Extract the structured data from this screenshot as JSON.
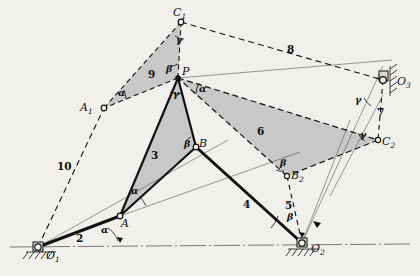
{
  "figure": {
    "type": "kinematic-linkage-diagram",
    "background_color": "#f2f0ec",
    "fill_color": "#c8c8c8",
    "stroke_color": "#111111"
  },
  "points": [
    {
      "id": "O1",
      "label": "O",
      "sub": "1",
      "x": 38,
      "y": 247,
      "kind": "ground-pivot"
    },
    {
      "id": "O2",
      "label": "O",
      "sub": "2",
      "x": 302,
      "y": 243,
      "kind": "ground-pivot"
    },
    {
      "id": "O3",
      "label": "O",
      "sub": "3",
      "x": 383,
      "y": 80,
      "kind": "ground-pivot"
    },
    {
      "id": "A",
      "label": "A",
      "sub": "",
      "x": 120,
      "y": 216,
      "kind": "joint"
    },
    {
      "id": "B",
      "label": "B",
      "sub": "",
      "x": 196,
      "y": 147,
      "kind": "joint"
    },
    {
      "id": "P",
      "label": "P",
      "sub": "",
      "x": 178,
      "y": 78,
      "kind": "joint"
    },
    {
      "id": "A1",
      "label": "A",
      "sub": "1",
      "x": 104,
      "y": 108,
      "kind": "joint"
    },
    {
      "id": "B2",
      "label": "B",
      "sub": "2",
      "x": 287,
      "y": 176,
      "kind": "joint"
    },
    {
      "id": "C1",
      "label": "C",
      "sub": "1",
      "x": 181,
      "y": 22,
      "kind": "joint"
    },
    {
      "id": "C2",
      "label": "C",
      "sub": "2",
      "x": 378,
      "y": 140,
      "kind": "joint"
    }
  ],
  "links": [
    {
      "id": "link2",
      "number": "2",
      "from": "O1",
      "to": "A",
      "style": "solid-thick",
      "label_x": 76,
      "label_y": 233
    },
    {
      "id": "link3",
      "number": "3",
      "from": "P",
      "to": "A",
      "style": "shaded-triangle",
      "label_x": 151,
      "label_y": 150
    },
    {
      "id": "link4",
      "number": "4",
      "from": "B",
      "to": "O2",
      "style": "solid-thick",
      "label_x": 243,
      "label_y": 199
    },
    {
      "id": "link5",
      "number": "5",
      "from": "B2",
      "to": "O2",
      "style": "dashed",
      "label_x": 285,
      "label_y": 208
    },
    {
      "id": "link6",
      "number": "6",
      "from": "P",
      "to": "C2",
      "style": "shaded-quad",
      "label_x": 257,
      "label_y": 132
    },
    {
      "id": "link7",
      "number": "7",
      "from": "O3",
      "to": "C2",
      "style": "dashed",
      "label_x": 375,
      "label_y": 113
    },
    {
      "id": "link8",
      "number": "8",
      "from": "C1",
      "to": "O3",
      "style": "dashed",
      "label_x": 287,
      "label_y": 48
    },
    {
      "id": "link9",
      "number": "9",
      "from": "A1",
      "to": "C1",
      "style": "shaded-triangle",
      "label_x": 150,
      "label_y": 74
    },
    {
      "id": "link10",
      "number": "10",
      "from": "O1",
      "to": "A1",
      "style": "dashed",
      "label_x": 62,
      "label_y": 167
    }
  ],
  "angles": [
    {
      "id": "ang-alpha-O1",
      "symbol": "α",
      "x": 101,
      "y": 232
    },
    {
      "id": "ang-alpha-A",
      "symbol": "α",
      "x": 133,
      "y": 194
    },
    {
      "id": "ang-alpha-A1",
      "symbol": "α",
      "x": 119,
      "y": 94
    },
    {
      "id": "ang-alpha-P",
      "symbol": "α",
      "x": 201,
      "y": 90
    },
    {
      "id": "ang-beta-P",
      "symbol": "β",
      "x": 167,
      "y": 71
    },
    {
      "id": "ang-beta-B",
      "symbol": "β",
      "x": 184,
      "y": 145
    },
    {
      "id": "ang-beta-B2",
      "symbol": "β",
      "x": 282,
      "y": 165
    },
    {
      "id": "ang-beta-O2",
      "symbol": "β",
      "x": 289,
      "y": 219
    },
    {
      "id": "ang-gamma-C1",
      "symbol": "γ",
      "x": 177,
      "y": 42
    },
    {
      "id": "ang-gamma-Pd",
      "symbol": "γ",
      "x": 175,
      "y": 96
    },
    {
      "id": "ang-gamma-O3",
      "symbol": "γ",
      "x": 356,
      "y": 102
    },
    {
      "id": "ang-gamma-C2",
      "symbol": "γ",
      "x": 362,
      "y": 136
    }
  ]
}
